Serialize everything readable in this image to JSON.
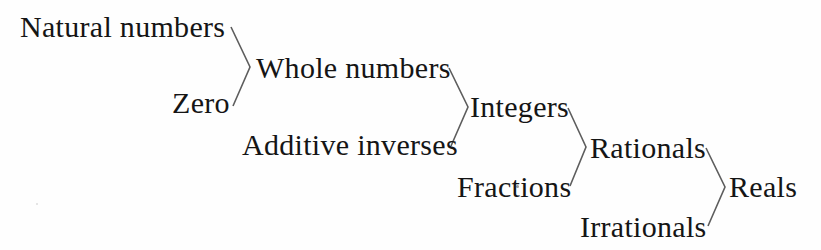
{
  "diagram": {
    "background_color": "#fefefe",
    "line_color": "#5d5d5d",
    "text_color": "#151515",
    "nodes": {
      "natural_numbers": "Natural numbers",
      "zero": "Zero",
      "whole_numbers": "Whole numbers",
      "additive_inverses": "Additive inverses",
      "integers": "Integers",
      "fractions": "Fractions",
      "rationals": "Rationals",
      "irrationals": "Irrationals",
      "reals": "Reals"
    },
    "brackets": [
      {
        "name": "whole-numbers-bracket",
        "inputs": [
          "Natural numbers",
          "Zero"
        ],
        "output": "Whole numbers"
      },
      {
        "name": "integers-bracket",
        "inputs": [
          "Whole numbers",
          "Additive inverses"
        ],
        "output": "Integers"
      },
      {
        "name": "rationals-bracket",
        "inputs": [
          "Integers",
          "Fractions"
        ],
        "output": "Rationals"
      },
      {
        "name": "reals-bracket",
        "inputs": [
          "Rationals",
          "Irrationals"
        ],
        "output": "Reals"
      }
    ]
  }
}
